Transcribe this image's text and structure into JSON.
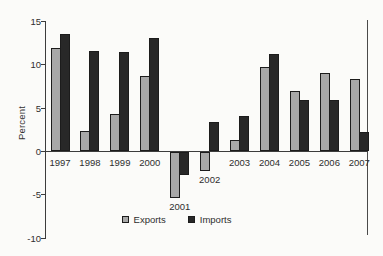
{
  "chart_data": {
    "type": "bar",
    "title": "",
    "xlabel": "",
    "ylabel": "Percent",
    "categories": [
      "1997",
      "1998",
      "1999",
      "2000",
      "2001",
      "2002",
      "2003",
      "2004",
      "2005",
      "2006",
      "2007"
    ],
    "series": [
      {
        "name": "Exports",
        "color": "#a8a8a8",
        "values": [
          11.9,
          2.4,
          4.3,
          8.7,
          -5.4,
          -2.3,
          1.3,
          9.7,
          7.0,
          9.1,
          8.4
        ]
      },
      {
        "name": "Imports",
        "color": "#282828",
        "values": [
          13.6,
          11.6,
          11.5,
          13.1,
          -2.7,
          3.4,
          4.1,
          11.3,
          5.9,
          6.0,
          2.2
        ]
      }
    ],
    "ylim": [
      -10,
      15
    ],
    "yticks": [
      15,
      10,
      5,
      0,
      -5,
      -10
    ],
    "grid": false,
    "legend_position": "bottom-center",
    "colors": {
      "axis": "#3c3c3c",
      "bar_border": "#1c1c1c",
      "background": "#fbfbf9"
    }
  }
}
